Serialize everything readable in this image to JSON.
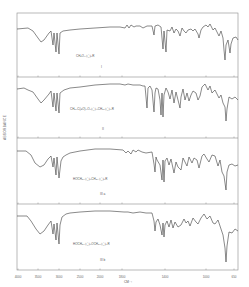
{
  "figure": {
    "y_axis_label": "ABSORBANCE",
    "x_axis_label": "CM⁻¹",
    "x_ticks": [
      {
        "label": "4000",
        "x": 18
      },
      {
        "label": "3500",
        "x": 38
      },
      {
        "label": "3000",
        "x": 59
      },
      {
        "label": "2500",
        "x": 80
      },
      {
        "label": "2000",
        "x": 100
      },
      {
        "label": "1800",
        "x": 122
      },
      {
        "label": "1400",
        "x": 165
      },
      {
        "label": "1000",
        "x": 206
      },
      {
        "label": "650",
        "x": 234
      }
    ],
    "panels": [
      {
        "id": "I",
        "label": "I",
        "structure": "CH₃O–⟨◯⟩–R",
        "top": 13,
        "bottom": 77,
        "points": "17,29 28,28 33,31 38,38 41,42 44,40 49,33 51,31 53,45 54,33 56,52 57,33 59,54 60,33 63,31 70,30 80,29 95,28 110,27 120,27 125,28 127,25 129,28 131,25 134,27 136,26 140,26 143,28 147,26 152,26 154,35 155,26 158,25 161,27 163,49 164,31 166,52 167,30 170,31 172,27 174,33 176,29 178,31 180,36 182,28 184,31 186,33 188,30 191,29 193,31 195,29 198,34 199,38 201,30 203,27 206,25 208,27 210,24 213,30 215,28 219,36 221,31 223,38 224,50 225,60 226,45 228,40 230,53 231,44 233,38 236,37 238,40"
      },
      {
        "id": "II",
        "label": "II",
        "structure": "CH₃–C(=O)–O–⟨◯⟩–CH₂–⟨◯⟩–R",
        "top": 77,
        "bottom": 138,
        "points": "17,89 24,88 28,90 33,92 38,99 41,103 44,100 49,94 51,91 53,107 54,93 56,111 57,93 59,113 60,93 64,90 70,88 80,87 95,85 110,84 120,84 125,85 128,84 133,85 140,85 143,86 145,86 147,108 148,88 150,86 152,90 154,112 155,93 156,88 158,89 160,100 161,115 162,93 163,117 164,95 166,88 168,92 170,99 172,90 174,103 176,92 178,100 180,108 181,97 183,89 185,100 187,93 189,101 191,95 193,91 196,93 198,100 200,96 202,87 205,84 208,90 210,86 212,93 215,90 219,98 221,95 223,103 225,107 226,121 227,109 229,97 232,99 235,97 238,100"
      },
      {
        "id": "IIIa",
        "label": "III a",
        "structure": "HOCH₂–⟨◯⟩–CH₂–⟨◯⟩–R",
        "top": 138,
        "bottom": 204,
        "points": "17,151 26,151 31,155 35,163 40,167 44,165 48,159 51,156 53,167 54,158 56,175 57,157 59,178 61,161 63,157 66,155 70,153 80,151 95,149 110,149 123,150 126,153 128,151 131,154 133,150 136,152 138,150 142,152 146,153 152,152 154,164 155,172 156,157 157,160 160,165 162,180 163,160 164,182 165,161 167,158 169,165 171,159 174,173 176,162 178,167 181,170 183,158 185,162 187,166 189,157 192,163 194,158 197,160 199,168 202,156 204,154 207,159 209,162 212,155 215,156 218,166 220,160 222,172 224,176 226,190 227,172 229,165 232,164 235,166 238,165"
      },
      {
        "id": "IIIb",
        "label": "III b",
        "structure": "HOCH₂–⟨◯⟩–OCH₂–⟨◯⟩–R",
        "top": 204,
        "bottom": 270,
        "points": "17,216 27,216 31,221 36,229 40,234 44,231 48,225 51,221 53,234 54,224 56,240 57,223 59,244 60,225 62,217 66,214 70,213 80,212 95,211 110,211 124,212 128,212 133,213 140,212 146,213 152,213 154,221 155,231 156,222 158,219 160,225 162,235 163,223 164,237 165,225 167,221 169,227 171,220 173,228 175,222 178,227 181,225 184,219 186,223 188,221 190,226 193,218 196,222 198,224 201,218 204,214 207,219 210,216 213,223 215,224 218,220 221,229 223,235 225,248 226,262 227,246 229,232 232,233 235,229 238,231"
      }
    ],
    "frame": {
      "left": 17,
      "right": 238,
      "top": 13,
      "bottom": 270
    },
    "line_color": "#3a3a3a",
    "frame_color": "#8a8a8a"
  }
}
